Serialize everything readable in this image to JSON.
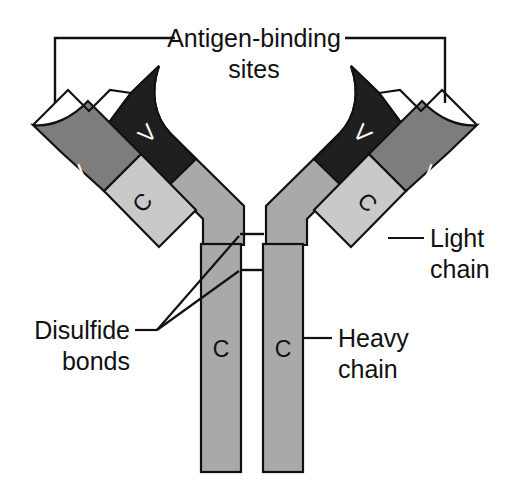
{
  "figure": {
    "width": 510,
    "height": 493,
    "background": "#ffffff"
  },
  "labels": {
    "antigen_binding_line1": "Antigen-binding",
    "antigen_binding_line2": "sites",
    "light_chain_line1": "Light",
    "light_chain_line2": "chain",
    "heavy_chain_line1": "Heavy",
    "heavy_chain_line2": "chain",
    "disulfide_line1": "Disulfide",
    "disulfide_line2": "bonds"
  },
  "domain_letters": {
    "variable": "V",
    "constant": "C"
  },
  "domains": {
    "left_light_variable": "V",
    "left_light_constant": "C",
    "left_heavy_variable": "V",
    "left_heavy_constant": "C",
    "right_light_variable": "V",
    "right_light_constant": "C",
    "right_heavy_variable": "V",
    "right_heavy_constant": "C"
  },
  "colors": {
    "outline": "#111111",
    "background": "#ffffff",
    "heavy_variable_fill": "#1f1f1f",
    "heavy_constant_fill": "#a9a9a9",
    "light_variable_fill": "#7d7d7d",
    "light_constant_fill": "#c9c9c9",
    "text": "#111111",
    "letter_on_dark": "#ffffff",
    "letter_on_light": "#111111"
  },
  "structure": {
    "chain_count": 4,
    "heavy_chain_count": 2,
    "light_chain_count": 2,
    "antigen_binding_site_count": 2,
    "disulfide_bond_count": 2
  }
}
